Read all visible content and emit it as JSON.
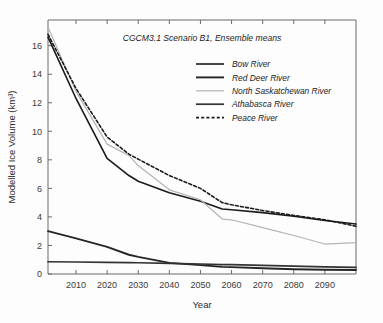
{
  "chart_data": {
    "type": "line",
    "title": "CGCM3.1 Scenario B1, Ensemble means",
    "xlabel": "Year",
    "ylabel": "Modelled Ice Volume (km³)",
    "xlim": [
      2001,
      2100
    ],
    "ylim": [
      0,
      17.8
    ],
    "xticks": [
      2010,
      2020,
      2030,
      2040,
      2050,
      2060,
      2070,
      2080,
      2090
    ],
    "xtick_labels": [
      "2010",
      "2020",
      "2030",
      "2040",
      "2050",
      "2060",
      "2070",
      "2080",
      "2090"
    ],
    "yticks": [
      0,
      2,
      4,
      6,
      8,
      10,
      12,
      14,
      16
    ],
    "ytick_labels": [
      "0",
      "2",
      "4",
      "6",
      "8",
      "10",
      "12",
      "14",
      "16"
    ],
    "grid": false,
    "legend_position": "upper-right-inside",
    "x": [
      2001,
      2010,
      2020,
      2027,
      2030,
      2040,
      2050,
      2057,
      2060,
      2070,
      2080,
      2090,
      2100
    ],
    "series": [
      {
        "name": "Bow River",
        "color": "#1a1a1a",
        "style": "solid",
        "width": 1.6,
        "values": [
          16.6,
          12.3,
          8.1,
          6.9,
          6.5,
          5.7,
          5.1,
          4.55,
          4.5,
          4.3,
          4.05,
          3.75,
          3.5
        ]
      },
      {
        "name": "Red Deer River",
        "color": "#262626",
        "style": "solid",
        "width": 1.9,
        "values": [
          3.0,
          2.5,
          1.9,
          1.35,
          1.2,
          0.78,
          0.62,
          0.5,
          0.48,
          0.4,
          0.33,
          0.3,
          0.28
        ]
      },
      {
        "name": "North Saskatchewan River",
        "color": "#b4b4b4",
        "style": "solid",
        "width": 1.2,
        "values": [
          17.3,
          12.8,
          9.1,
          8.3,
          7.6,
          5.9,
          5.2,
          3.85,
          3.8,
          3.25,
          2.7,
          2.1,
          2.2
        ]
      },
      {
        "name": "Athabasca River",
        "color": "#333333",
        "style": "solid",
        "width": 1.7,
        "values": [
          0.86,
          0.84,
          0.82,
          0.8,
          0.79,
          0.75,
          0.7,
          0.66,
          0.65,
          0.6,
          0.55,
          0.5,
          0.46
        ]
      },
      {
        "name": "Peace River",
        "color": "#1a1a1a",
        "style": "dashed",
        "width": 1.6,
        "values": [
          16.8,
          13.0,
          9.6,
          8.4,
          8.05,
          6.9,
          6.0,
          5.0,
          4.85,
          4.45,
          4.1,
          3.8,
          3.35
        ]
      }
    ]
  }
}
